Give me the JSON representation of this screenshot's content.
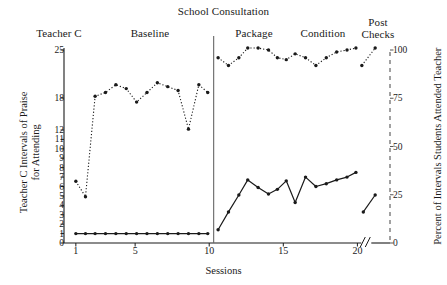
{
  "chart_data": {
    "type": "line",
    "title": "School Consultation",
    "subject": "Teacher C",
    "xlabel": "Sessions",
    "ylabel_left": "Teacher C Intervals of Praise for Attending",
    "ylabel_left_line1": "Teacher C Intervals of Praise",
    "ylabel_left_line2": "for Attending",
    "ylabel_right": "Percent of Intervals Students Attended Teacher",
    "xlim": [
      0.2,
      22.2
    ],
    "ylim_left": [
      0,
      25
    ],
    "ylim_right": [
      0,
      100
    ],
    "grid": false,
    "legend": "none",
    "axis_break_x": 20.6,
    "phase_divider_x": 10.3,
    "xticks": [
      1,
      5,
      10,
      15,
      20
    ],
    "yticks_left": [
      0,
      1,
      2,
      3,
      4,
      5,
      6,
      7,
      8,
      9,
      10,
      11,
      12,
      18,
      25
    ],
    "yticks_right": [
      0,
      25,
      50,
      75,
      100
    ],
    "phases": [
      {
        "label": "Teacher C",
        "align": "left"
      },
      {
        "label": "Baseline",
        "align": "center"
      },
      {
        "label": "Package",
        "align": "center"
      },
      {
        "label": "Condition",
        "align": "center"
      },
      {
        "label": "Post\nChecks",
        "line1": "Post",
        "line2": "Checks",
        "align": "center"
      }
    ],
    "series": [
      {
        "name": "Percent of Intervals Students Attended Teacher",
        "axis": "right",
        "style": "dotted",
        "marker": "filled-circle",
        "segments": [
          {
            "phase": "Baseline",
            "x": [
              1,
              1.65,
              2.3,
              3,
              3.7,
              4.4,
              5.1,
              5.8,
              6.5,
              7.2,
              7.9,
              8.6,
              9.3,
              9.9
            ],
            "y": [
              32,
              24,
              76,
              78,
              82,
              80,
              73,
              78,
              83,
              81,
              79,
              59,
              82,
              78
            ]
          },
          {
            "phase": "Package Condition",
            "x": [
              10.6,
              11.3,
              12.0,
              12.6,
              13.3,
              14.0,
              14.6,
              15.2,
              15.8,
              16.5,
              17.2,
              17.9,
              18.6,
              19.3,
              19.9
            ],
            "y": [
              96,
              92,
              96,
              101,
              101,
              100,
              96,
              95,
              98,
              96,
              92,
              96,
              99,
              100,
              101
            ]
          },
          {
            "phase": "Post Checks",
            "x": [
              20.3,
              21.2
            ],
            "y": [
              92,
              101
            ]
          }
        ]
      },
      {
        "name": "Teacher C Intervals of Praise for Attending",
        "axis": "left",
        "style": "solid",
        "marker": "filled-circle",
        "segments": [
          {
            "phase": "Baseline",
            "x": [
              1,
              1.65,
              2.3,
              3,
              3.7,
              4.4,
              5.1,
              5.8,
              6.5,
              7.2,
              7.9,
              8.6,
              9.3,
              9.9
            ],
            "y": [
              1,
              1,
              1,
              1,
              1,
              1,
              1,
              1,
              1,
              1,
              1,
              1,
              1,
              1
            ]
          },
          {
            "phase": "Package Condition",
            "x": [
              10.6,
              11.3,
              12.0,
              12.6,
              13.3,
              14.0,
              14.6,
              15.2,
              15.8,
              16.5,
              17.2,
              17.9,
              18.6,
              19.3,
              19.9
            ],
            "y": [
              1.4,
              3.3,
              5.1,
              6.7,
              5.9,
              5.2,
              5.7,
              6.6,
              4.3,
              7.0,
              6.0,
              6.3,
              6.7,
              7.0,
              7.5
            ]
          },
          {
            "phase": "Post Checks",
            "x": [
              20.4,
              21.2
            ],
            "y": [
              3.3,
              5.1
            ]
          }
        ]
      }
    ]
  }
}
